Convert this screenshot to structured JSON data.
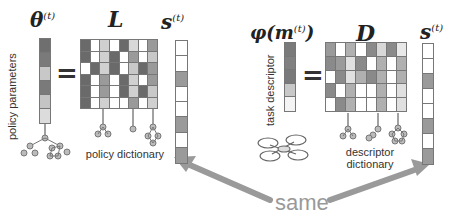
{
  "left_panel": {
    "theta_label": "θ",
    "theta_sup": "(t)",
    "vertical_label": "policy parameters",
    "equals": "=",
    "L_label": "L",
    "s_label": "s",
    "s_sup": "(t)",
    "caption": "policy dictionary",
    "theta_cells": [
      "#6f6f6f",
      "#7a7a7a",
      "#c8c8c8",
      "#7a7a7a",
      "#c4c4c4",
      "#dcdcdc"
    ],
    "L_rows": 6,
    "L_cols": 8
  },
  "right_panel": {
    "phi_label": "φ(m",
    "phi_sup": "(t)",
    "phi_close": ")",
    "vertical_label": "task descriptor",
    "equals": "=",
    "D_label": "D",
    "s_label": "s",
    "s_sup": "(t)",
    "caption_line1": "descriptor",
    "caption_line2": "dictionary",
    "phi_cells": [
      "#7a7a7a",
      "#808080",
      "#7a7a7a",
      "#c8c8c8",
      "#f4f4f4"
    ],
    "D_rows": 5,
    "D_cols": 8
  },
  "s_vector_cells": [
    "#ffffff",
    "#ffffff",
    "#9a9a9a",
    "#ffffff",
    "#ffffff",
    "#9a9a9a",
    "#ffffff",
    "#9a9a9a"
  ],
  "annotation": {
    "same_label": "same",
    "arrow_color": "#9a9a9a"
  }
}
